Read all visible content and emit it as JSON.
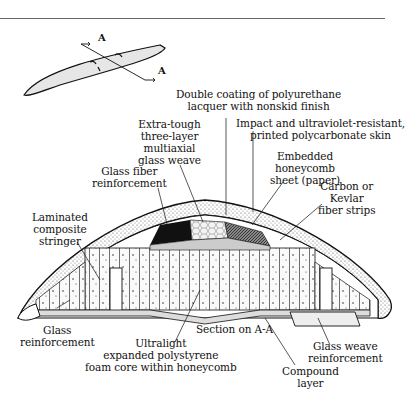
{
  "figure": {
    "section_marker": "A",
    "caption": "Section on A-A"
  },
  "labels": {
    "double_coating": [
      "Double coating of polyurethane",
      "lacquer with nonskid finish"
    ],
    "impact_skin": [
      "Impact and ultraviolet-resistant,",
      "printed polycarbonate skin"
    ],
    "multiaxial": [
      "Extra-tough",
      "three-layer",
      "multiaxial",
      "glass weave"
    ],
    "honeycomb_sheet": [
      "Embedded",
      "honeycomb",
      "sheet (paper)"
    ],
    "glass_fiber": [
      "Glass fiber",
      "reinforcement"
    ],
    "carbon_kevlar": [
      "Carbon or",
      "Kevlar",
      "fiber strips"
    ],
    "stringer": [
      "Laminated",
      "composite",
      "stringer"
    ],
    "glass_reinf": [
      "Glass",
      "reinforcement"
    ],
    "foam_core": [
      "Ultralight",
      "expanded polystyrene",
      "foam core within honeycomb"
    ],
    "glass_weave": [
      "Glass weave",
      "reinforcement"
    ],
    "compound": [
      "Compound",
      "layer"
    ]
  },
  "colors": {
    "ink": "#111111",
    "rule": "#666666",
    "board_fill": "#e6e6e6",
    "stipple": "#d8d8d8"
  }
}
